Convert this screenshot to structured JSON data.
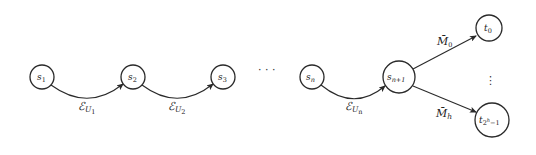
{
  "diagram": {
    "type": "state-chain-with-branching",
    "colors": {
      "stroke": "#2a2a2a",
      "text": "#222222",
      "background": "#ffffff"
    },
    "nodes": [
      {
        "id": "s1",
        "base": "s",
        "sub": "1",
        "cx": 42,
        "cy": 77,
        "r": 12
      },
      {
        "id": "s2",
        "base": "s",
        "sub": "2",
        "cx": 133,
        "cy": 77,
        "r": 12
      },
      {
        "id": "s3",
        "base": "s",
        "sub": "3",
        "cx": 223,
        "cy": 77,
        "r": 12
      },
      {
        "id": "sn",
        "base": "s",
        "sub": "n",
        "cx": 312,
        "cy": 77,
        "r": 12
      },
      {
        "id": "sn1",
        "base": "s",
        "sub": "n+1",
        "cx": 399,
        "cy": 77,
        "r": 16
      },
      {
        "id": "t0",
        "base": "t",
        "sub": "0",
        "cx": 489,
        "cy": 28,
        "r": 13
      },
      {
        "id": "t2h1",
        "base": "t",
        "sub": "2^h−1",
        "sub_base": "2",
        "sub_sup": "h",
        "sub_tail": "−1",
        "cx": 492,
        "cy": 120,
        "r": 17
      }
    ],
    "edges": [
      {
        "from": "s1",
        "to": "s2",
        "label_base": "ℰ",
        "label_sub": "U",
        "label_subsub": "1"
      },
      {
        "from": "s2",
        "to": "s3",
        "label_base": "ℰ",
        "label_sub": "U",
        "label_subsub": "2"
      },
      {
        "from": "sn",
        "to": "sn1",
        "label_base": "ℰ",
        "label_sub": "U",
        "label_subsub": "n"
      },
      {
        "from": "sn1",
        "to": "t0",
        "label_base": "M̄",
        "label_sub": "0"
      },
      {
        "from": "sn1",
        "to": "t2h1",
        "label_base": "M̄",
        "label_sub": "h"
      }
    ],
    "ellipses": {
      "horizontal": "· · ·",
      "vertical": "⋮"
    }
  }
}
